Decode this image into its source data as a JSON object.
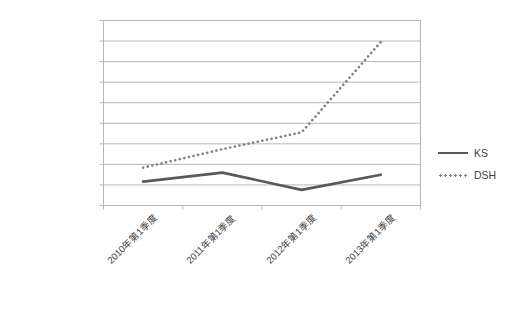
{
  "chart_data": {
    "type": "line",
    "title": "",
    "subtitle": "",
    "xlabel": "",
    "ylabel": "",
    "categories": [
      "2010年第1季度",
      "2011年第1季度",
      "2012年第1季度",
      "2013年第1季度"
    ],
    "ylim": [
      0,
      450000
    ],
    "ytick_step": 50000,
    "ytick_labels": [
      "¥450,000.00",
      "¥400,000.00",
      "¥350,000.00",
      "¥300,000.00",
      "¥250,000.00",
      "¥200,000.00",
      "¥150,000.00",
      "¥100,000.00",
      "¥50,000.00",
      "¥0.00"
    ],
    "ytick_values": [
      450000,
      400000,
      350000,
      300000,
      250000,
      200000,
      150000,
      100000,
      50000,
      0
    ],
    "grid": true,
    "grid_axis": "y",
    "legend_position": "right",
    "series": [
      {
        "name": "KS",
        "style": "solid",
        "color": "#595959",
        "values": [
          58000,
          80000,
          38000,
          75000
        ]
      },
      {
        "name": "DSH",
        "style": "dotted",
        "color": "#808080",
        "values": [
          92000,
          137000,
          178000,
          398000
        ]
      }
    ]
  },
  "legend": {
    "entries": [
      {
        "label": "KS",
        "key": "solid-line-key"
      },
      {
        "label": "DSH",
        "key": "dotted-line-key"
      }
    ]
  },
  "colors": {
    "series_ks": "#595959",
    "series_dsh": "#808080",
    "gridline": "#b7b7b7",
    "axis": "#b7b7b7",
    "text": "#3f3f3f",
    "background": "#ffffff"
  }
}
